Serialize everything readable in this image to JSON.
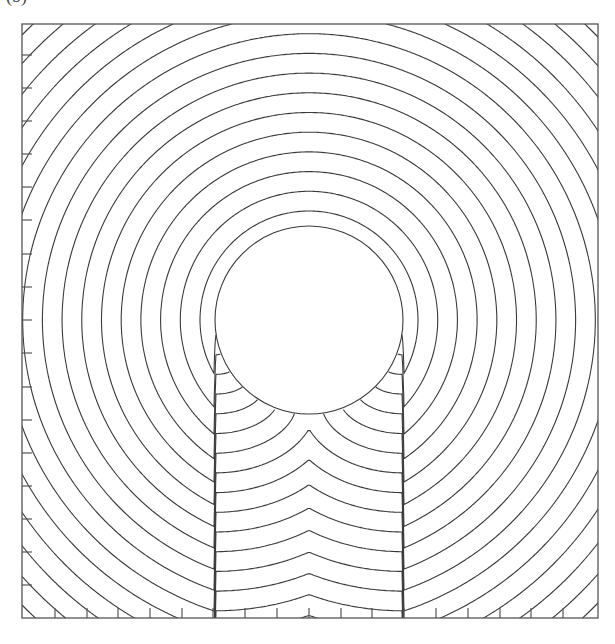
{
  "panel_label": "(b)",
  "figure": {
    "frame": {
      "x0": 22,
      "y0": 24,
      "x1": 598,
      "y1": 618
    },
    "obstacle": {
      "cx": 309,
      "cy": 320,
      "r": 94
    },
    "wavefronts": {
      "first_offset": 15,
      "spacing": 19.7,
      "count": 40
    },
    "left_axis_ticks_y": [
      55,
      88,
      121,
      154,
      187,
      220,
      254,
      287,
      320,
      353,
      387,
      420,
      453,
      486,
      519,
      552,
      585
    ],
    "bottom_axis_ticks_x": [
      55,
      87,
      118,
      150,
      182,
      213,
      245,
      277,
      309,
      341,
      372,
      404,
      436,
      468,
      500,
      531,
      563
    ],
    "tick_length": 10,
    "colors": {
      "line": "#3a3a3a",
      "frame": "#555555",
      "background": "#ffffff"
    }
  }
}
